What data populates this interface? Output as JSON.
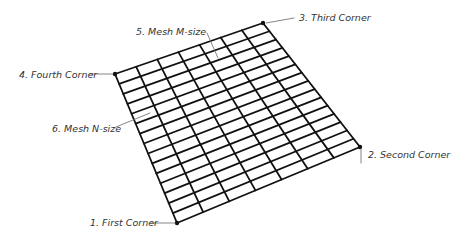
{
  "title_cropped": "(partially visible caption at top)",
  "mesh": {
    "columns": 7,
    "rows": 15,
    "line_color": "#111111",
    "leader_color": "#666666",
    "corners": {
      "first": [
        177,
        223
      ],
      "second": [
        360,
        147
      ],
      "third": [
        263,
        23
      ],
      "fourth": [
        115,
        74
      ]
    }
  },
  "labels": {
    "first_corner": "1. First Corner",
    "second_corner": "2. Second Corner",
    "third_corner": "3. Third Corner",
    "fourth_corner": "4. Fourth Corner",
    "mesh_m_size": "5. Mesh M-size",
    "mesh_n_size": "6. Mesh N-size"
  }
}
